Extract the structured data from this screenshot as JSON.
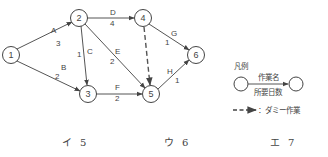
{
  "diagram": {
    "type": "arrow-diagram",
    "nodes": [
      {
        "id": "1",
        "label": "1",
        "x": 11,
        "y": 55
      },
      {
        "id": "2",
        "label": "2",
        "x": 79,
        "y": 18
      },
      {
        "id": "3",
        "label": "3",
        "x": 88,
        "y": 94
      },
      {
        "id": "4",
        "label": "4",
        "x": 143,
        "y": 18
      },
      {
        "id": "5",
        "label": "5",
        "x": 151,
        "y": 94
      },
      {
        "id": "6",
        "label": "6",
        "x": 196,
        "y": 55
      }
    ],
    "edges": [
      {
        "from": "1",
        "to": "2",
        "name": "A",
        "days": "3"
      },
      {
        "from": "1",
        "to": "3",
        "name": "B",
        "days": "2"
      },
      {
        "from": "2",
        "to": "3",
        "name": "C",
        "days": "1"
      },
      {
        "from": "2",
        "to": "4",
        "name": "D",
        "days": "4"
      },
      {
        "from": "2",
        "to": "5",
        "name": "E",
        "days": "2"
      },
      {
        "from": "3",
        "to": "5",
        "name": "F",
        "days": "2"
      },
      {
        "from": "4",
        "to": "6",
        "name": "G",
        "days": "1"
      },
      {
        "from": "5",
        "to": "6",
        "name": "H",
        "days": "1"
      },
      {
        "from": "4",
        "to": "5",
        "name": "",
        "days": "",
        "dummy": true
      }
    ]
  },
  "legend": {
    "title": "凡例",
    "task_name": "作業名",
    "required_days": "所要日数",
    "dummy_label": "：ダミー作業"
  },
  "answers": [
    {
      "key": "イ",
      "value": "5"
    },
    {
      "key": "ウ",
      "value": "6"
    },
    {
      "key": "エ",
      "value": "7"
    }
  ]
}
